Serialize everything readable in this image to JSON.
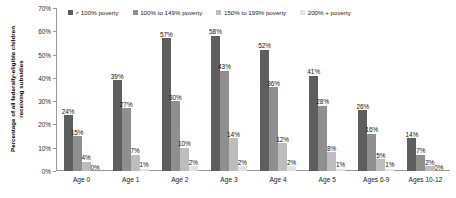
{
  "chart_data": {
    "type": "bar",
    "title": "",
    "subtitle": "",
    "xlabel": "",
    "ylabel": "Percentage of all federally-eligible children receiving subsidies",
    "ylim": [
      0,
      70
    ],
    "y_tick_labels": [
      "0%",
      "10%",
      "20%",
      "30%",
      "40%",
      "50%",
      "60%",
      "70%"
    ],
    "y_ticks": [
      0,
      10,
      20,
      30,
      40,
      50,
      60,
      70
    ],
    "grid": false,
    "legend_position": "top",
    "categories": [
      "Age 0",
      "Age 1",
      "Age 2",
      "Age 3",
      "Age 4",
      "Age 5",
      "Ages 6-9",
      "Ages 10-12"
    ],
    "series": [
      {
        "name": "< 100% poverty",
        "color": "#5e5e5e",
        "values": [
          24,
          39,
          57,
          58,
          52,
          41,
          26,
          14
        ],
        "labels": [
          "24%",
          "39%",
          "57%",
          "58%",
          "52%",
          "41%",
          "26%",
          "14%"
        ]
      },
      {
        "name": "100% to 149% poverty",
        "color": "#8f8f8f",
        "values": [
          15,
          27,
          30,
          43,
          36,
          28,
          16,
          7
        ],
        "labels": [
          "15%",
          "27%",
          "30%",
          "43%",
          "36%",
          "28%",
          "16%",
          "7%"
        ]
      },
      {
        "name": "150% to 199% poverty",
        "color": "#bdbdbd",
        "values": [
          4,
          7,
          10,
          14,
          12,
          8,
          5,
          2
        ],
        "labels": [
          "4%",
          "7%",
          "10%",
          "14%",
          "12%",
          "8%",
          "5%",
          "2%"
        ]
      },
      {
        "name": "200% + poverty",
        "color": "#e2e2e2",
        "values": [
          0,
          1,
          2,
          2,
          2,
          1,
          1,
          0
        ],
        "labels": [
          "0%",
          "1%",
          "2%",
          "2%",
          "2%",
          "1%",
          "1%",
          "0%"
        ]
      }
    ]
  }
}
